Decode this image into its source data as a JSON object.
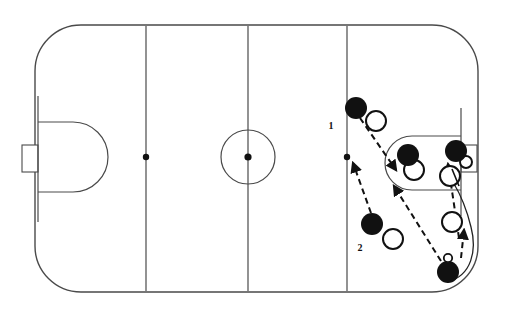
{
  "diagram": {
    "type": "hockey-rink-play-diagram",
    "colors": {
      "ink": "#222222",
      "line": "#444444",
      "fill_player": "#111111",
      "background": "#ffffff"
    },
    "rink": {
      "left": 35,
      "top": 25,
      "right": 478,
      "bottom": 292,
      "corner_radius": 46,
      "stroke_width": 1.3
    },
    "lines": [
      {
        "name": "left-goal-line",
        "x": 38,
        "y1": 98,
        "y2": 220
      },
      {
        "name": "left-blue-line",
        "x": 146,
        "y1": 26,
        "y2": 291
      },
      {
        "name": "center-red-line",
        "x": 248,
        "y1": 26,
        "y2": 291
      },
      {
        "name": "right-blue-line",
        "x": 347,
        "y1": 26,
        "y2": 291
      },
      {
        "name": "right-goal-line",
        "x": 461,
        "y1": 108,
        "y2": 214
      }
    ],
    "faceoff_dots": [
      {
        "name": "left-neutral-dot",
        "cx": 146,
        "cy": 157,
        "r": 3
      },
      {
        "name": "center-ice-dot",
        "cx": 248,
        "cy": 157,
        "r": 3.4
      },
      {
        "name": "right-neutral-dot",
        "cx": 347,
        "cy": 157,
        "r": 3
      }
    ],
    "center_circle": {
      "cx": 248,
      "cy": 157,
      "r": 27
    },
    "left_crease_zone": {
      "x": 38,
      "y_top": 122,
      "y_bottom": 192,
      "extent_x": 106
    },
    "right_end_zone_arc": {
      "x_start": 461,
      "y_top": 136,
      "y_bottom": 186,
      "extent_x": 388
    },
    "goals": [
      {
        "name": "left-goal-net",
        "x": 22,
        "y": 144,
        "w": 16,
        "h": 28
      },
      {
        "name": "right-goal-net",
        "x": 461,
        "y": 144,
        "w": 16,
        "h": 28
      }
    ],
    "labels": [
      {
        "name": "label-1",
        "text": "1",
        "x": 333,
        "y": 128
      },
      {
        "name": "label-2",
        "text": "2",
        "x": 360,
        "y": 250
      }
    ],
    "players_filled": [
      {
        "name": "player-filled-point",
        "cx": 356,
        "cy": 108,
        "r": 11
      },
      {
        "name": "player-filled-slot",
        "cx": 408,
        "cy": 155,
        "r": 11
      },
      {
        "name": "player-filled-net-front",
        "cx": 455,
        "cy": 151,
        "r": 11
      },
      {
        "name": "player-filled-low",
        "cx": 372,
        "cy": 224,
        "r": 11
      },
      {
        "name": "player-filled-corner",
        "cx": 448,
        "cy": 271,
        "r": 11
      }
    ],
    "players_open": [
      {
        "name": "player-open-point",
        "cx": 376,
        "cy": 121,
        "r": 10
      },
      {
        "name": "player-open-slot",
        "cx": 414,
        "cy": 170,
        "r": 10
      },
      {
        "name": "player-open-net-side",
        "cx": 450,
        "cy": 175,
        "r": 10
      },
      {
        "name": "player-open-goal-crease",
        "cx": 465,
        "cy": 162,
        "r": 6
      },
      {
        "name": "player-open-low",
        "cx": 393,
        "cy": 239,
        "r": 10
      },
      {
        "name": "player-open-halfwall",
        "cx": 452,
        "cy": 222,
        "r": 10
      }
    ],
    "puck": {
      "name": "puck",
      "cx": 448,
      "cy": 258,
      "r": 4
    },
    "arrows": [
      {
        "name": "pass-arrow-point-to-slot",
        "style": "dashed",
        "path": "M 358,118 L 397,172",
        "head_at": [
          397,
          172
        ],
        "head_angle": 54
      },
      {
        "name": "skate-arrow-low-to-point",
        "style": "dashed",
        "path": "M 370,214 L 352,162",
        "head_at": [
          352,
          162
        ],
        "head_angle": -109
      },
      {
        "name": "pass-arrow-corner-to-slot",
        "style": "dashed",
        "path": "M 441,262 L 393,185",
        "head_at": [
          393,
          185
        ],
        "head_angle": -122
      },
      {
        "name": "pass-arrow-to-net-front",
        "style": "dashed",
        "path": "M 459,240 L 448,163",
        "head_at": [
          448,
          163
        ],
        "head_angle": -98
      },
      {
        "name": "skate-arrow-up-halfwall",
        "style": "dashed",
        "path": "M 462,262 L 464,232",
        "head_at": [
          464,
          232
        ],
        "head_angle": -86
      }
    ],
    "curves": [
      {
        "name": "carry-curve-behind-net",
        "path": "M 448,271 C 470,268 474,248 470,226 C 467,204 460,190 452,180"
      },
      {
        "name": "stick-mark-crease",
        "path": "M 452,170 L 460,186"
      }
    ]
  }
}
